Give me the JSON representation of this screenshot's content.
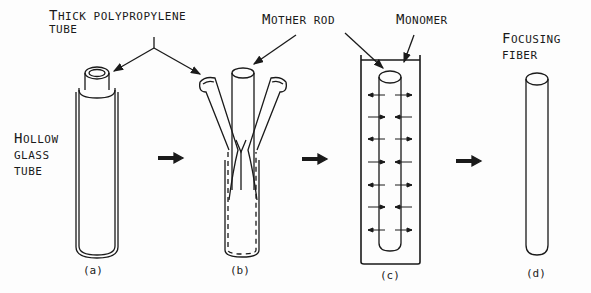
{
  "diagram": {
    "labels": {
      "thick_tube_line1_big": "T",
      "thick_tube_line1_rest": "HICK POLYPROPYLENE",
      "thick_tube_line2": "TUBE",
      "mother_rod_big": "M",
      "mother_rod_rest": "OTHER ROD",
      "monomer_big": "M",
      "monomer_rest": "ONOMER",
      "hollow_big": "H",
      "hollow_rest": "OLLOW",
      "glass": "GLASS",
      "tube": "TUBE",
      "focusing_big": "F",
      "focusing_rest": "OCUSING",
      "fiber": "FIBER"
    },
    "captions": [
      "(a)",
      "(b)",
      "(c)",
      "(d)"
    ],
    "steps": [
      {
        "id": "a",
        "description": "Hollow glass tube with thick polypropylene tube"
      },
      {
        "id": "b",
        "description": "Mother rod inserted, polypropylene tube peeled"
      },
      {
        "id": "c",
        "description": "Mother rod in monomer, diffusion"
      },
      {
        "id": "d",
        "description": "Focusing fiber"
      }
    ],
    "colors": {
      "ink": "#1a1a1a",
      "background": "#fdfdfd"
    }
  }
}
